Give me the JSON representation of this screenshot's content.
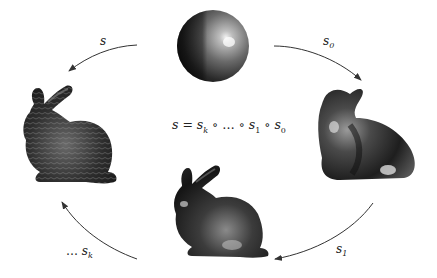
{
  "figure": {
    "formula": {
      "lhs": "s",
      "eq": " = ",
      "terms": [
        "s",
        "k",
        " ∘ … ∘ ",
        "s",
        "1",
        " ∘ ",
        "s",
        "0"
      ]
    },
    "arrows": [
      {
        "id": "s",
        "label": "s",
        "sub": "",
        "prefix": "",
        "from": "sphere",
        "to": "detailed-bunny"
      },
      {
        "id": "s0",
        "label": "s",
        "sub": "0",
        "prefix": "",
        "from": "sphere",
        "to": "smooth-bunny"
      },
      {
        "id": "s1",
        "label": "s",
        "sub": "1",
        "prefix": "",
        "from": "smooth-bunny",
        "to": "medium-bunny"
      },
      {
        "id": "sk",
        "label": "s",
        "sub": "k",
        "prefix": "… ",
        "from": "medium-bunny",
        "to": "detailed-bunny"
      }
    ],
    "objects": [
      {
        "id": "sphere",
        "label": "sphere"
      },
      {
        "id": "smooth-bunny",
        "label": "coarse smooth bunny"
      },
      {
        "id": "medium-bunny",
        "label": "intermediate bunny"
      },
      {
        "id": "detailed-bunny",
        "label": "detailed bunny"
      }
    ],
    "colors": {
      "arrow": "#333333",
      "text": "#222222",
      "object_dark": "#1a1a1a",
      "object_highlight": "#e6e6e6"
    }
  }
}
